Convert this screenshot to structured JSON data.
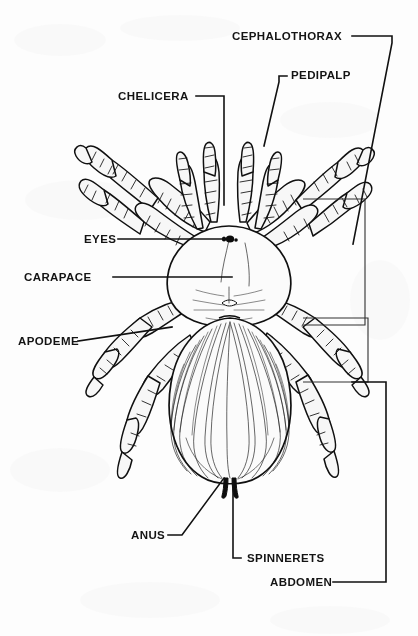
{
  "figure": {
    "view": "dorsal",
    "background_color": "#fdfdfd",
    "ink_color": "#111111"
  },
  "labels": [
    {
      "id": "cephalothorax",
      "text": "CEPHALOTHORAX",
      "x": 232,
      "y": 40,
      "anchor": "start"
    },
    {
      "id": "pedipalp",
      "text": "PEDIPALP",
      "x": 291,
      "y": 79,
      "anchor": "start"
    },
    {
      "id": "chelicera",
      "text": "CHELICERA",
      "x": 118,
      "y": 100,
      "anchor": "start"
    },
    {
      "id": "eyes",
      "text": "EYES",
      "x": 84,
      "y": 243,
      "anchor": "start"
    },
    {
      "id": "carapace",
      "text": "CARAPACE",
      "x": 24,
      "y": 281,
      "anchor": "start"
    },
    {
      "id": "apodeme",
      "text": "APODEME",
      "x": 18,
      "y": 345,
      "anchor": "start"
    },
    {
      "id": "anus",
      "text": "ANUS",
      "x": 131,
      "y": 539,
      "anchor": "start"
    },
    {
      "id": "spinnerets",
      "text": "SPINNERETS",
      "x": 247,
      "y": 562,
      "anchor": "start"
    },
    {
      "id": "abdomen",
      "text": "ABDOMEN",
      "x": 270,
      "y": 586,
      "anchor": "start"
    }
  ],
  "leader_lines": {
    "cephalothorax": "M 352 36 L 392 36 L 392 43 L 353 244",
    "pedipalp": "M 287 76 L 279 76 L 279 82 L 264 146",
    "chelicera": "M 196 96 L 224 96 L 224 205",
    "eyes": "M 118 239 L 229 239",
    "carapace": "M 113 277 L 232 277",
    "apodeme": "M 78 341 L 172 327",
    "anus": "M 168 535 L 182 535 L 224 478",
    "spinnerets": "M 241 558 L 233 558 L 233 480",
    "abdomen": "M 333 582 L 386 582 L 386 382 L 352 382"
  },
  "parts": {
    "cephalothorax_note": "light carapace plate with radiating fovea striae",
    "abdomen_note": "large hairy opisthosoma with radiating setae",
    "legs_count": 8,
    "pedipalps_count": 2,
    "chelicerae_count": 2,
    "spinnerets_count": 2
  }
}
